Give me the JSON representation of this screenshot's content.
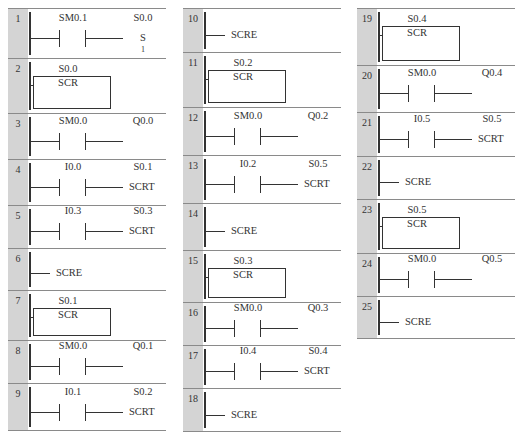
{
  "columns": [
    {
      "networks": [
        {
          "num": "1",
          "type": "contact_coil",
          "contact": "SM0.1",
          "coil_addr": "S0.0",
          "coil": "S",
          "coil_param": "1"
        },
        {
          "num": "2",
          "type": "scr",
          "addr": "S0.0",
          "label": "SCR"
        },
        {
          "num": "3",
          "type": "contact_coil",
          "contact": "SM0.0",
          "coil_addr": "Q0.0",
          "coil": ""
        },
        {
          "num": "4",
          "type": "contact_coil",
          "contact": "I0.0",
          "coil_addr": "S0.1",
          "coil": "SCRT"
        },
        {
          "num": "5",
          "type": "contact_coil",
          "contact": "I0.3",
          "coil_addr": "S0.3",
          "coil": "SCRT"
        },
        {
          "num": "6",
          "type": "scre",
          "label": "SCRE"
        },
        {
          "num": "7",
          "type": "scr",
          "addr": "S0.1",
          "label": "SCR"
        },
        {
          "num": "8",
          "type": "contact_coil",
          "contact": "SM0.0",
          "coil_addr": "Q0.1",
          "coil": ""
        },
        {
          "num": "9",
          "type": "contact_coil",
          "contact": "I0.1",
          "coil_addr": "S0.2",
          "coil": "SCRT"
        }
      ]
    },
    {
      "networks": [
        {
          "num": "10",
          "type": "scre",
          "label": "SCRE"
        },
        {
          "num": "11",
          "type": "scr",
          "addr": "S0.2",
          "label": "SCR"
        },
        {
          "num": "12",
          "type": "contact_coil",
          "contact": "SM0.0",
          "coil_addr": "Q0.2",
          "coil": ""
        },
        {
          "num": "13",
          "type": "contact_coil",
          "contact": "I0.2",
          "coil_addr": "S0.5",
          "coil": "SCRT"
        },
        {
          "num": "14",
          "type": "scre",
          "label": "SCRE"
        },
        {
          "num": "15",
          "type": "scr",
          "addr": "S0.3",
          "label": "SCR"
        },
        {
          "num": "16",
          "type": "contact_coil",
          "contact": "SM0.0",
          "coil_addr": "Q0.3",
          "coil": ""
        },
        {
          "num": "17",
          "type": "contact_coil",
          "contact": "I0.4",
          "coil_addr": "S0.4",
          "coil": "SCRT"
        },
        {
          "num": "18",
          "type": "scre",
          "label": "SCRE"
        }
      ]
    },
    {
      "networks": [
        {
          "num": "19",
          "type": "scr",
          "addr": "S0.4",
          "label": "SCR"
        },
        {
          "num": "20",
          "type": "contact_coil",
          "contact": "SM0.0",
          "coil_addr": "Q0.4",
          "coil": ""
        },
        {
          "num": "21",
          "type": "contact_coil",
          "contact": "I0.5",
          "coil_addr": "S0.5",
          "coil": "SCRT"
        },
        {
          "num": "22",
          "type": "scre",
          "label": "SCRE"
        },
        {
          "num": "23",
          "type": "scr",
          "addr": "S0.5",
          "label": "SCR"
        },
        {
          "num": "24",
          "type": "contact_coil",
          "contact": "SM0.0",
          "coil_addr": "Q0.5",
          "coil": ""
        },
        {
          "num": "25",
          "type": "scre",
          "label": "SCRE"
        }
      ]
    }
  ],
  "layout": {
    "col_x": [
      8,
      183,
      357
    ],
    "col_w": [
      158,
      158,
      158
    ],
    "boundaries": [
      [
        0,
        50,
        105,
        151,
        197,
        240,
        282,
        332,
        375,
        423
      ],
      [
        0,
        44,
        99,
        147,
        195,
        242,
        294,
        337,
        380,
        424
      ],
      [
        0,
        57,
        104,
        148,
        191,
        245,
        288,
        331
      ]
    ]
  }
}
